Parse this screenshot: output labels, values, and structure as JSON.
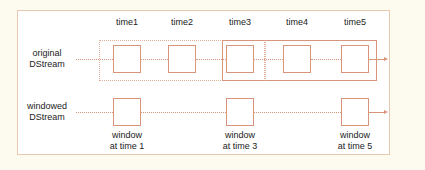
{
  "diagram": {
    "time_labels": [
      "time1",
      "time2",
      "time3",
      "time4",
      "time5"
    ],
    "rows": [
      {
        "label_line1": "original",
        "label_line2": "DStream"
      },
      {
        "label_line1": "windowed",
        "label_line2": "DStream"
      }
    ],
    "window_labels": [
      {
        "line1": "window",
        "line2": "at time 1"
      },
      {
        "line1": "window",
        "line2": "at time 3"
      },
      {
        "line1": "window",
        "line2": "at time 5"
      }
    ],
    "colors": {
      "box_stroke": "#d9957a",
      "frame_stroke": "#e8c9b0",
      "background": "#fdfaf0"
    }
  }
}
